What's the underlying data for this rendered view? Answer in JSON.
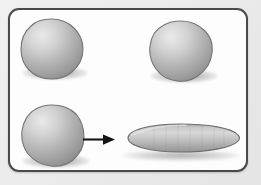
{
  "figure": {
    "frame": {
      "border_color": "#4a4a4a",
      "fill_color": "#fdfdfd",
      "corner_radius": "11"
    },
    "background_color": "#ebebeb",
    "shape_colors": {
      "highlight": "#e6e6e6",
      "midtone": "#b5b5b5",
      "shadow_edge": "#8d8d8d",
      "outline": "#6e6e6e",
      "cast_shadow": "#9a9a9a"
    },
    "objects": [
      {
        "id": "blob-top-left",
        "label": "sphere",
        "row": "top",
        "column": "left",
        "x": 22,
        "y": 20,
        "width": 60,
        "height": 58
      },
      {
        "id": "blob-top-right",
        "label": "sphere",
        "row": "top",
        "column": "right",
        "x": 150,
        "y": 22,
        "width": 62,
        "height": 59
      },
      {
        "id": "blob-bottom-left",
        "label": "sphere",
        "row": "bottom",
        "column": "left",
        "x": 22,
        "y": 106,
        "width": 61,
        "height": 60
      },
      {
        "id": "disc-bottom-right",
        "label": "flattened ellipsoid",
        "row": "bottom",
        "column": "right",
        "x": 118,
        "y": 123,
        "width": 120,
        "height": 30
      }
    ],
    "arrow": {
      "id": "transform-arrow",
      "label": "transforms into",
      "direction": "right",
      "x1": 84,
      "y1": 137,
      "x2": 114,
      "y2": 137,
      "color": "#141414"
    }
  }
}
